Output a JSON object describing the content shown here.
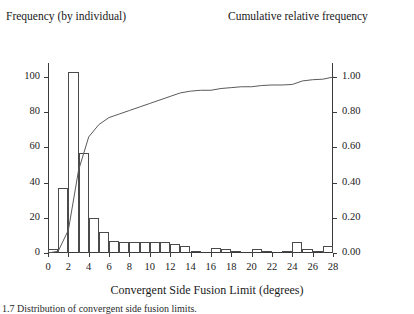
{
  "titles": {
    "left": "Frequency (by individual)",
    "right": "Cumulative relative frequency"
  },
  "xlabel": "Convergent Side Fusion Limit (degrees)",
  "caption": "1.7 Distribution of convergent side fusion limits.",
  "chart_data": {
    "type": "bar",
    "title": "",
    "xlabel": "Convergent Side Fusion Limit (degrees)",
    "ylabel": "Frequency (by individual)",
    "y2label": "Cumulative relative frequency",
    "xlim": [
      0,
      28
    ],
    "ylim": [
      0,
      108
    ],
    "y2lim": [
      0.0,
      1.08
    ],
    "grid": false,
    "legend": "none",
    "xticks": [
      0,
      2,
      4,
      6,
      8,
      10,
      12,
      14,
      16,
      18,
      20,
      22,
      24,
      26,
      28
    ],
    "xtick_labels": [
      "0",
      "2",
      "4",
      "6",
      "8",
      "10",
      "12",
      "14",
      "16",
      "18",
      "20",
      "22",
      "24",
      "26",
      "28"
    ],
    "yticks": [
      0,
      20,
      40,
      60,
      80,
      100
    ],
    "ytick_labels": [
      "0",
      "20",
      "40",
      "60",
      "80",
      "100"
    ],
    "y2ticks": [
      0.0,
      0.2,
      0.4,
      0.6,
      0.8,
      1.0
    ],
    "y2tick_labels": [
      "0.00",
      "0.20",
      "0.40",
      "0.60",
      "0.80",
      "1.00"
    ],
    "bin_width": 1,
    "bin_starts": [
      0,
      1,
      2,
      3,
      4,
      5,
      6,
      7,
      8,
      9,
      10,
      11,
      12,
      13,
      14,
      15,
      16,
      17,
      18,
      19,
      20,
      21,
      22,
      23,
      24,
      25,
      26,
      27
    ],
    "categories": [
      "0-1",
      "1-2",
      "2-3",
      "3-4",
      "4-5",
      "5-6",
      "6-7",
      "7-8",
      "8-9",
      "9-10",
      "10-11",
      "11-12",
      "12-13",
      "13-14",
      "14-15",
      "15-16",
      "16-17",
      "17-18",
      "18-19",
      "19-20",
      "20-21",
      "21-22",
      "22-23",
      "23-24",
      "24-25",
      "25-26",
      "26-27",
      "27-28"
    ],
    "values": [
      2,
      37,
      103,
      57,
      20,
      12,
      7,
      6,
      6,
      6,
      6,
      6,
      5,
      4,
      1,
      0,
      3,
      2,
      1,
      0,
      2,
      1,
      0,
      1,
      6,
      2,
      1,
      4
    ],
    "series": [
      {
        "name": "Frequency (by individual)",
        "type": "bar",
        "axis": "left",
        "values": [
          2,
          37,
          103,
          57,
          20,
          12,
          7,
          6,
          6,
          6,
          6,
          6,
          5,
          4,
          1,
          0,
          3,
          2,
          1,
          0,
          2,
          1,
          0,
          1,
          6,
          2,
          1,
          4
        ]
      },
      {
        "name": "Cumulative relative frequency",
        "type": "line",
        "axis": "right",
        "x": [
          0,
          1,
          2,
          3,
          4,
          5,
          6,
          7,
          8,
          9,
          10,
          11,
          12,
          13,
          14,
          15,
          16,
          17,
          18,
          19,
          20,
          21,
          22,
          23,
          24,
          25,
          26,
          27,
          28
        ],
        "values": [
          0.0,
          0.01,
          0.13,
          0.47,
          0.66,
          0.73,
          0.77,
          0.79,
          0.81,
          0.83,
          0.85,
          0.87,
          0.89,
          0.91,
          0.92,
          0.925,
          0.925,
          0.935,
          0.94,
          0.945,
          0.945,
          0.952,
          0.955,
          0.955,
          0.958,
          0.978,
          0.985,
          0.988,
          1.0
        ]
      }
    ]
  }
}
